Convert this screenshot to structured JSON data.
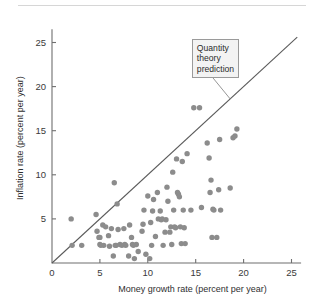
{
  "figure": {
    "background_color": "#ffffff",
    "dot_color": "#8c8c8c",
    "line_color": "#5a5a5a",
    "axis_color": "#6f6f6f"
  },
  "annotation": {
    "name": "quantity-theory-callout",
    "line1": "Quantity",
    "line2": "theory",
    "line3": "prediction"
  },
  "chart_data": {
    "type": "scatter",
    "title": "",
    "subtitle": "",
    "xlabel": "Money growth rate (percent per year)",
    "ylabel": "Inflation rate (percent per year)",
    "xlim": [
      0,
      26
    ],
    "ylim": [
      0,
      26.5
    ],
    "xticks": [
      0,
      5,
      10,
      15,
      20,
      25
    ],
    "yticks": [
      0,
      5,
      10,
      15,
      20,
      25
    ],
    "xtick_labels": [
      "0",
      "5",
      "10",
      "15",
      "20",
      "25"
    ],
    "ytick_labels": [
      "0",
      "5",
      "10",
      "15",
      "20",
      "25"
    ],
    "grid": false,
    "legend": "none",
    "annotations": [
      {
        "text": "Quantity theory prediction",
        "target_x": 18.6,
        "target_y": 18.6,
        "box_x": 14.6,
        "box_y": 25.4
      }
    ],
    "reference_lines": [
      {
        "name": "quantity-theory-prediction",
        "label": "45-degree line (inflation = money growth)",
        "type": "identity",
        "slope": 1,
        "intercept": 0,
        "x_start": 0,
        "x_end": 25.6
      }
    ],
    "series": [
      {
        "name": "countries",
        "marker": "circle",
        "color": "#8c8c8c",
        "points": [
          [
            2.0,
            5.0
          ],
          [
            2.1,
            2.0
          ],
          [
            3.1,
            2.0
          ],
          [
            4.6,
            5.5
          ],
          [
            4.7,
            3.6
          ],
          [
            4.9,
            2.9
          ],
          [
            5.0,
            2.9
          ],
          [
            5.0,
            2.1
          ],
          [
            5.1,
            2.0
          ],
          [
            5.3,
            4.3
          ],
          [
            5.4,
            2.0
          ],
          [
            5.6,
            4.1
          ],
          [
            5.9,
            3.1
          ],
          [
            6.0,
            1.9
          ],
          [
            6.2,
            3.9
          ],
          [
            6.4,
            0.8
          ],
          [
            6.5,
            9.1
          ],
          [
            6.6,
            2.0
          ],
          [
            6.7,
            2.0
          ],
          [
            6.8,
            6.7
          ],
          [
            6.9,
            3.8
          ],
          [
            7.1,
            2.1
          ],
          [
            7.3,
            2.0
          ],
          [
            7.5,
            3.9
          ],
          [
            7.6,
            2.1
          ],
          [
            7.7,
            2.0
          ],
          [
            8.0,
            0.8
          ],
          [
            8.1,
            4.3
          ],
          [
            8.3,
            2.9
          ],
          [
            8.4,
            2.1
          ],
          [
            8.5,
            2.0
          ],
          [
            8.6,
            0.5
          ],
          [
            8.8,
            2.1
          ],
          [
            9.0,
            1.3
          ],
          [
            9.4,
            3.6
          ],
          [
            9.5,
            4.4
          ],
          [
            9.6,
            6.0
          ],
          [
            9.8,
            1.0
          ],
          [
            10.0,
            7.6
          ],
          [
            10.2,
            0.5
          ],
          [
            10.3,
            4.6
          ],
          [
            10.4,
            2.0
          ],
          [
            10.5,
            5.9
          ],
          [
            10.6,
            7.2
          ],
          [
            10.8,
            3.0
          ],
          [
            11.0,
            8.0
          ],
          [
            11.1,
            5.0
          ],
          [
            11.3,
            5.9
          ],
          [
            11.4,
            4.9
          ],
          [
            11.5,
            5.0
          ],
          [
            11.6,
            2.0
          ],
          [
            11.8,
            3.5
          ],
          [
            11.9,
            4.9
          ],
          [
            12.0,
            8.6
          ],
          [
            12.1,
            7.0
          ],
          [
            12.3,
            3.5
          ],
          [
            12.4,
            4.1
          ],
          [
            12.5,
            2.1
          ],
          [
            12.6,
            10.3
          ],
          [
            12.7,
            6.0
          ],
          [
            12.8,
            4.1
          ],
          [
            12.9,
            4.0
          ],
          [
            13.0,
            11.8
          ],
          [
            13.1,
            8.0
          ],
          [
            13.2,
            7.8
          ],
          [
            13.3,
            7.5
          ],
          [
            13.4,
            4.1
          ],
          [
            13.5,
            2.2
          ],
          [
            13.6,
            11.5
          ],
          [
            13.7,
            6.0
          ],
          [
            13.8,
            4.0
          ],
          [
            13.9,
            2.2
          ],
          [
            14.1,
            12.4
          ],
          [
            14.5,
            6.0
          ],
          [
            14.8,
            17.6
          ],
          [
            15.4,
            17.6
          ],
          [
            15.6,
            6.3
          ],
          [
            16.2,
            13.6
          ],
          [
            16.4,
            11.9
          ],
          [
            16.5,
            8.0
          ],
          [
            16.6,
            9.4
          ],
          [
            16.8,
            6.1
          ],
          [
            16.9,
            6.0
          ],
          [
            16.7,
            2.9
          ],
          [
            17.2,
            2.9
          ],
          [
            17.4,
            8.3
          ],
          [
            17.5,
            14.0
          ],
          [
            17.6,
            6.0
          ],
          [
            18.6,
            8.5
          ],
          [
            18.9,
            14.2
          ],
          [
            19.1,
            14.4
          ],
          [
            19.3,
            15.2
          ]
        ]
      }
    ]
  }
}
